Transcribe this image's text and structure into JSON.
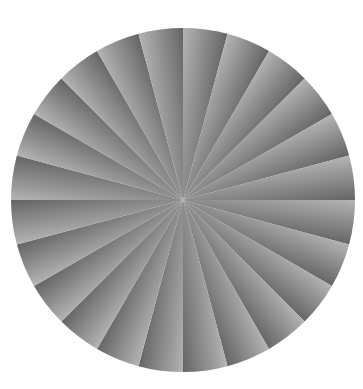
{
  "image": {
    "title": "Radial sector gradient disc",
    "kind": "pinwheel-gradient-test-pattern",
    "width": 363,
    "height": 389,
    "background_color": "#ffffff"
  },
  "figure": {
    "shape": "circle",
    "center_x": 183,
    "center_y": 200,
    "radius": 172,
    "sector_count": 24,
    "sector_angle_degrees": 15,
    "start_angle_degrees": 0,
    "sweep_direction": "clockwise",
    "gradient_start_color": "#ffffff",
    "gradient_end_color": "#070707",
    "gradient_mid_color": "#8a8a8a",
    "gradient_description": "Each sector ramps from white at its counter-clockwise edge to near-black at its clockwise edge, producing a hard white/black discontinuity at every sector boundary.",
    "edge_antialias": true,
    "outer_edge_color": "#ffffff"
  },
  "chart_data": {
    "type": "pie",
    "xlabel": "",
    "ylabel": "",
    "legend_position": "none",
    "grid": false,
    "categories": [
      "S1",
      "S2",
      "S3",
      "S4",
      "S5",
      "S6",
      "S7",
      "S8",
      "S9",
      "S10",
      "S11",
      "S12",
      "S13",
      "S14",
      "S15",
      "S16",
      "S17",
      "S18",
      "S19",
      "S20",
      "S21",
      "S22",
      "S23",
      "S24"
    ],
    "values": [
      15,
      15,
      15,
      15,
      15,
      15,
      15,
      15,
      15,
      15,
      15,
      15,
      15,
      15,
      15,
      15,
      15,
      15,
      15,
      15,
      15,
      15,
      15,
      15
    ],
    "start_angles": [
      0,
      15,
      30,
      45,
      60,
      75,
      90,
      105,
      120,
      135,
      150,
      165,
      180,
      195,
      210,
      225,
      240,
      255,
      270,
      285,
      300,
      315,
      330,
      345
    ],
    "end_angles": [
      15,
      30,
      45,
      60,
      75,
      90,
      105,
      120,
      135,
      150,
      165,
      180,
      195,
      210,
      225,
      240,
      255,
      270,
      285,
      300,
      315,
      330,
      345,
      360
    ],
    "fill_kind": "linear-gradient",
    "fill_from": "#ffffff",
    "fill_to": "#070707"
  }
}
